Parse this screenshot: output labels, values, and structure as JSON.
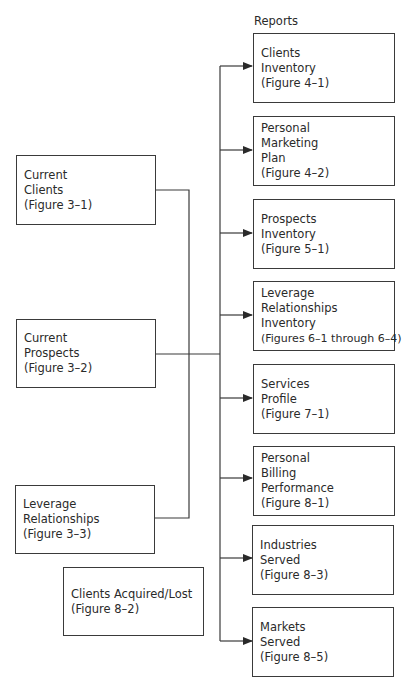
{
  "heading": "Reports",
  "sources": [
    {
      "id": "current-clients",
      "lines": [
        "Current",
        "Clients",
        "(Figure 3–1)"
      ]
    },
    {
      "id": "current-prospects",
      "lines": [
        "Current",
        "Prospects",
        "(Figure 3–2)"
      ]
    },
    {
      "id": "leverage-relationships",
      "lines": [
        "Leverage",
        "Relationships",
        "(Figure 3–3)"
      ]
    }
  ],
  "standalone": {
    "id": "clients-acquired-lost",
    "lines": [
      "Clients Acquired/Lost",
      "(Figure 8–2)"
    ]
  },
  "reports": [
    {
      "id": "clients-inventory",
      "lines": [
        "Clients",
        "Inventory",
        "(Figure 4–1)"
      ]
    },
    {
      "id": "personal-marketing-plan",
      "lines": [
        "Personal",
        "Marketing",
        "Plan",
        "(Figure 4–2)"
      ]
    },
    {
      "id": "prospects-inventory",
      "lines": [
        "Prospects",
        "Inventory",
        "(Figure 5–1)"
      ]
    },
    {
      "id": "leverage-relationships-inventory",
      "lines": [
        "Leverage",
        "Relationships",
        "Inventory",
        "(Figures 6–1 through 6–4)"
      ]
    },
    {
      "id": "services-profile",
      "lines": [
        "Services",
        "Profile",
        "(Figure 7–1)"
      ]
    },
    {
      "id": "personal-billing-performance",
      "lines": [
        "Personal",
        "Billing",
        "Performance",
        "(Figure 8–1)"
      ]
    },
    {
      "id": "industries-served",
      "lines": [
        "Industries",
        "Served",
        "(Figure 8–3)"
      ]
    },
    {
      "id": "markets-served",
      "lines": [
        "Markets",
        "Served",
        "(Figure 8–5)"
      ]
    }
  ],
  "colors": {
    "line": "#3a3a3a",
    "text": "#2a2a2a",
    "background": "#ffffff"
  }
}
